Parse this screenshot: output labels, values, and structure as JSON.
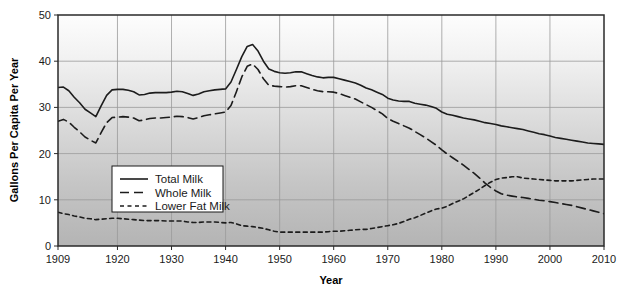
{
  "chart_data": {
    "type": "line",
    "title": "",
    "xlabel": "Year",
    "ylabel": "Gallons Per Capita Per Year",
    "xlim": [
      1909,
      2010
    ],
    "ylim": [
      0,
      50
    ],
    "grid": true,
    "legend_position": "inside-left-lower",
    "xticks": [
      "1909",
      "1920",
      "1930",
      "1940",
      "1950",
      "1960",
      "1970",
      "1980",
      "1990",
      "2000",
      "2010"
    ],
    "xtick_values": [
      1909,
      1920,
      1930,
      1940,
      1950,
      1960,
      1970,
      1980,
      1990,
      2000,
      2010
    ],
    "yticks": [
      "0",
      "10",
      "20",
      "30",
      "40",
      "50"
    ],
    "ytick_values": [
      0,
      10,
      20,
      30,
      40,
      50
    ],
    "x": [
      1909,
      1910,
      1911,
      1912,
      1913,
      1914,
      1915,
      1916,
      1917,
      1918,
      1919,
      1920,
      1921,
      1922,
      1923,
      1924,
      1925,
      1926,
      1927,
      1928,
      1929,
      1930,
      1931,
      1932,
      1933,
      1934,
      1935,
      1936,
      1937,
      1938,
      1939,
      1940,
      1941,
      1942,
      1943,
      1944,
      1945,
      1946,
      1947,
      1948,
      1949,
      1950,
      1951,
      1952,
      1953,
      1954,
      1955,
      1956,
      1957,
      1958,
      1959,
      1960,
      1961,
      1962,
      1963,
      1964,
      1965,
      1966,
      1967,
      1968,
      1969,
      1970,
      1971,
      1972,
      1973,
      1974,
      1975,
      1976,
      1977,
      1978,
      1979,
      1980,
      1981,
      1982,
      1983,
      1984,
      1985,
      1986,
      1987,
      1988,
      1989,
      1990,
      1991,
      1992,
      1993,
      1994,
      1995,
      1996,
      1997,
      1998,
      1999,
      2000,
      2001,
      2002,
      2003,
      2004,
      2005,
      2006,
      2007,
      2008,
      2009,
      2010
    ],
    "series": [
      {
        "name": "Total Milk",
        "style": "solid",
        "values": [
          34.3,
          34.4,
          33.6,
          32.2,
          31.0,
          29.6,
          28.8,
          28.0,
          30.4,
          32.6,
          33.8,
          33.9,
          33.9,
          33.7,
          33.4,
          32.7,
          32.8,
          33.1,
          33.2,
          33.2,
          33.2,
          33.3,
          33.5,
          33.4,
          33.0,
          32.6,
          32.9,
          33.4,
          33.6,
          33.8,
          33.9,
          34.0,
          35.5,
          38.2,
          41.0,
          43.2,
          43.6,
          42.2,
          40.0,
          38.3,
          37.8,
          37.5,
          37.4,
          37.5,
          37.7,
          37.7,
          37.3,
          36.9,
          36.6,
          36.4,
          36.5,
          36.5,
          36.2,
          35.9,
          35.6,
          35.3,
          34.8,
          34.2,
          33.8,
          33.3,
          32.8,
          32.0,
          31.6,
          31.4,
          31.3,
          31.3,
          30.9,
          30.7,
          30.5,
          30.2,
          29.8,
          29.0,
          28.5,
          28.3,
          28.0,
          27.7,
          27.5,
          27.3,
          27.0,
          26.7,
          26.5,
          26.3,
          26.0,
          25.8,
          25.6,
          25.4,
          25.2,
          24.9,
          24.6,
          24.3,
          24.1,
          23.8,
          23.5,
          23.3,
          23.1,
          22.9,
          22.7,
          22.5,
          22.3,
          22.2,
          22.1,
          22.0
        ]
      },
      {
        "name": "Whole Milk",
        "style": "dashed-long",
        "values": [
          27.0,
          27.4,
          26.8,
          25.7,
          24.7,
          23.6,
          22.9,
          22.3,
          24.6,
          26.7,
          27.8,
          27.9,
          28.0,
          27.9,
          27.7,
          27.1,
          27.3,
          27.6,
          27.7,
          27.7,
          27.8,
          27.9,
          28.1,
          28.0,
          27.8,
          27.5,
          27.8,
          28.2,
          28.4,
          28.6,
          28.8,
          29.0,
          30.4,
          33.4,
          36.6,
          38.9,
          39.4,
          38.2,
          36.2,
          34.8,
          34.6,
          34.5,
          34.4,
          34.5,
          34.7,
          34.7,
          34.3,
          33.9,
          33.6,
          33.4,
          33.4,
          33.3,
          33.0,
          32.6,
          32.2,
          31.8,
          31.2,
          30.6,
          30.0,
          29.3,
          28.6,
          27.6,
          27.0,
          26.5,
          26.0,
          25.5,
          24.8,
          24.1,
          23.4,
          22.6,
          21.8,
          20.8,
          19.9,
          19.1,
          18.3,
          17.5,
          16.6,
          15.7,
          14.7,
          13.6,
          12.7,
          11.9,
          11.3,
          11.0,
          10.8,
          10.6,
          10.5,
          10.3,
          10.1,
          9.9,
          9.8,
          9.6,
          9.4,
          9.2,
          9.0,
          8.8,
          8.5,
          8.2,
          7.9,
          7.6,
          7.3,
          7.0
        ]
      },
      {
        "name": "Lower Fat Milk",
        "style": "dashed-short",
        "values": [
          7.3,
          7.0,
          6.8,
          6.5,
          6.3,
          6.0,
          5.9,
          5.7,
          5.8,
          5.9,
          6.0,
          6.0,
          5.9,
          5.8,
          5.7,
          5.6,
          5.5,
          5.5,
          5.5,
          5.5,
          5.4,
          5.4,
          5.4,
          5.4,
          5.2,
          5.1,
          5.1,
          5.2,
          5.2,
          5.2,
          5.1,
          5.0,
          5.1,
          4.8,
          4.4,
          4.3,
          4.2,
          4.0,
          3.8,
          3.5,
          3.2,
          3.0,
          3.0,
          3.0,
          3.0,
          3.0,
          3.0,
          3.0,
          3.0,
          3.0,
          3.1,
          3.2,
          3.2,
          3.3,
          3.4,
          3.5,
          3.6,
          3.6,
          3.8,
          4.0,
          4.2,
          4.4,
          4.6,
          4.9,
          5.3,
          5.8,
          6.1,
          6.6,
          7.1,
          7.6,
          8.0,
          8.2,
          8.6,
          9.2,
          9.7,
          10.2,
          10.9,
          11.6,
          12.3,
          13.1,
          13.8,
          14.4,
          14.7,
          14.8,
          15.0,
          15.0,
          14.7,
          14.6,
          14.5,
          14.4,
          14.3,
          14.2,
          14.1,
          14.1,
          14.1,
          14.1,
          14.2,
          14.3,
          14.4,
          14.5,
          14.5,
          14.5
        ]
      }
    ]
  },
  "legend": {
    "items": [
      {
        "label": "Total Milk",
        "style": "solid"
      },
      {
        "label": "Whole Milk",
        "style": "dashed-long"
      },
      {
        "label": "Lower Fat Milk",
        "style": "dashed-short"
      }
    ]
  },
  "axes": {
    "x_title": "Year",
    "y_title": "Gallons Per Capita Per Year"
  }
}
